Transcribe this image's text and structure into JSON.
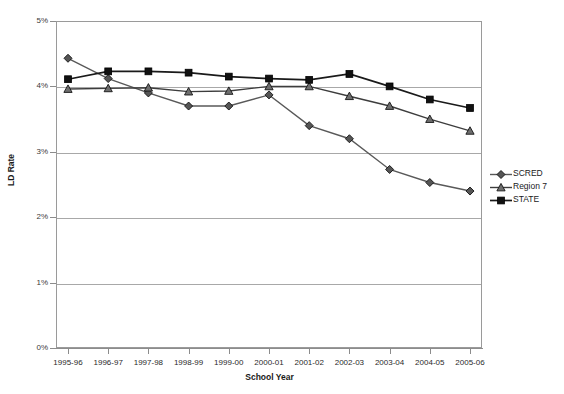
{
  "chart_data": {
    "type": "line",
    "title": "",
    "xlabel": "School Year",
    "ylabel": "LD Rate",
    "categories": [
      "1995-96",
      "1996-97",
      "1997-98",
      "1998-99",
      "1999-00",
      "2000-01",
      "2001-02",
      "2002-03",
      "2003-04",
      "2004-05",
      "2005-06"
    ],
    "ylim": [
      0,
      5
    ],
    "ytick_labels": [
      "0%",
      "1%",
      "2%",
      "3%",
      "4%",
      "5%"
    ],
    "ytick_values": [
      0,
      1,
      2,
      3,
      4,
      5
    ],
    "grid": "horizontal",
    "legend_position": "right",
    "series": [
      {
        "name": "SCRED",
        "marker": "diamond",
        "color": "#595959",
        "values": [
          4.43,
          4.12,
          3.9,
          3.7,
          3.7,
          3.87,
          3.4,
          3.2,
          2.73,
          2.53,
          2.4
        ]
      },
      {
        "name": "Region 7",
        "marker": "triangle",
        "color": "#3d3d3d",
        "values": [
          3.96,
          3.97,
          3.98,
          3.92,
          3.93,
          4.0,
          4.0,
          3.85,
          3.7,
          3.5,
          3.32
        ]
      },
      {
        "name": "STATE",
        "marker": "square",
        "color": "#1a1a1a",
        "values": [
          4.11,
          4.23,
          4.23,
          4.21,
          4.15,
          4.12,
          4.1,
          4.19,
          4.0,
          3.8,
          3.67
        ]
      }
    ]
  },
  "legend": {
    "items": [
      {
        "label": "SCRED",
        "marker": "diamond"
      },
      {
        "label": "Region 7",
        "marker": "triangle"
      },
      {
        "label": "STATE",
        "marker": "square"
      }
    ]
  },
  "axes": {
    "y_title": "LD Rate",
    "x_title": "School Year"
  }
}
